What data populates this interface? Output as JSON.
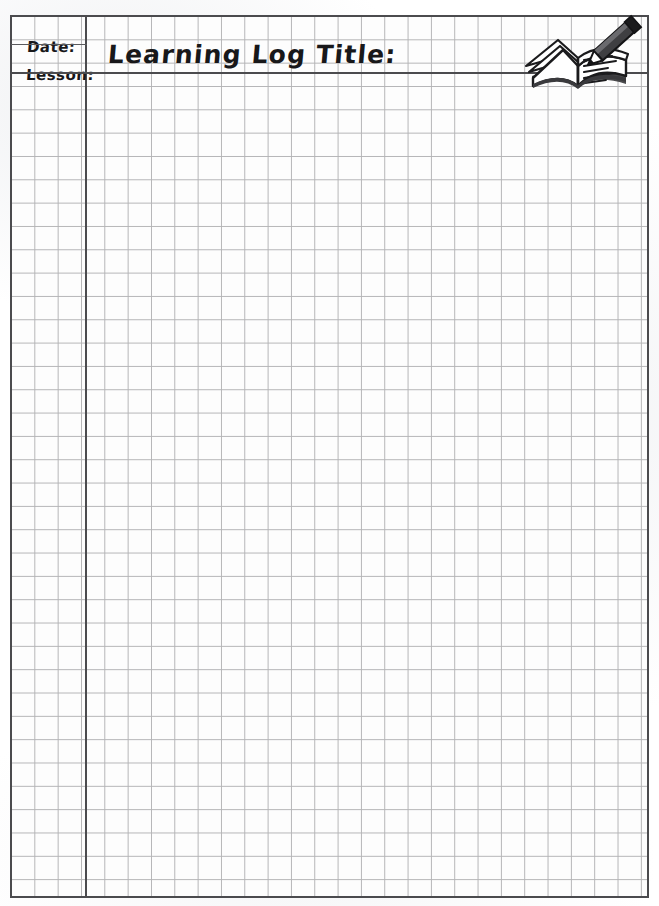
{
  "document": {
    "type": "worksheet",
    "name": "Learning Log graph paper worksheet",
    "paper_color": "#fdfdfd",
    "grid_line_color": "#b4b4b6",
    "frame_color": "#4b4b4e",
    "ink_color": "#18181a"
  },
  "header": {
    "date_label": "Date:",
    "lesson_label": "Lesson:",
    "title": "Learning Log Title:"
  },
  "icons": {
    "book_pencil": "open-book-with-pencil-icon"
  },
  "grid": {
    "cell_size_px": 23.33,
    "columns": 27,
    "rows": 35,
    "margin_columns": 3,
    "left_px": 11,
    "top_px": 16,
    "width_px": 637,
    "height_px": 881
  }
}
